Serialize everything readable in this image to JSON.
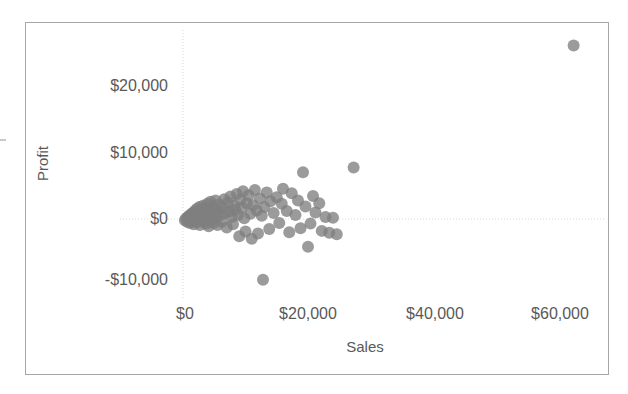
{
  "chart_data": {
    "type": "scatter",
    "title": "",
    "xlabel": "Sales",
    "ylabel": "Profit",
    "xticks": [
      "$0",
      "$20,000",
      "$40,000",
      "$60,000"
    ],
    "xtick_values": [
      0,
      20000,
      40000,
      60000
    ],
    "yticks": [
      "$20,000",
      "$10,000",
      "$0",
      "-$10,000"
    ],
    "ytick_values": [
      20000,
      10000,
      0,
      -10000
    ],
    "xlim": [
      -3000,
      66000
    ],
    "ylim": [
      -14000,
      28000
    ],
    "grid": "zero-lines-only",
    "legend": "none",
    "marker_color": "#7f7f7f",
    "marker_opacity": 0.78,
    "marker_radius": 6,
    "points": [
      [
        300,
        -200
      ],
      [
        500,
        100
      ],
      [
        650,
        -400
      ],
      [
        800,
        300
      ],
      [
        900,
        -100
      ],
      [
        1000,
        500
      ],
      [
        1100,
        -600
      ],
      [
        1200,
        200
      ],
      [
        1300,
        700
      ],
      [
        1400,
        -300
      ],
      [
        1500,
        900
      ],
      [
        1600,
        100
      ],
      [
        1700,
        -800
      ],
      [
        1800,
        600
      ],
      [
        1900,
        1200
      ],
      [
        2000,
        -200
      ],
      [
        2100,
        400
      ],
      [
        2200,
        1500
      ],
      [
        2300,
        -500
      ],
      [
        2400,
        800
      ],
      [
        2500,
        200
      ],
      [
        2600,
        1800
      ],
      [
        2700,
        -900
      ],
      [
        2800,
        600
      ],
      [
        2900,
        1300
      ],
      [
        3000,
        -100
      ],
      [
        3100,
        900
      ],
      [
        3200,
        2000
      ],
      [
        3300,
        -400
      ],
      [
        3400,
        500
      ],
      [
        3500,
        1600
      ],
      [
        3600,
        100
      ],
      [
        3700,
        -700
      ],
      [
        3800,
        1100
      ],
      [
        3900,
        2300
      ],
      [
        4000,
        300
      ],
      [
        4100,
        -1100
      ],
      [
        4200,
        1400
      ],
      [
        4300,
        700
      ],
      [
        4400,
        2600
      ],
      [
        4500,
        -300
      ],
      [
        4600,
        1000
      ],
      [
        4700,
        1900
      ],
      [
        4800,
        200
      ],
      [
        4900,
        -600
      ],
      [
        5000,
        1500
      ],
      [
        5200,
        2800
      ],
      [
        5400,
        400
      ],
      [
        5500,
        -900
      ],
      [
        5600,
        1200
      ],
      [
        5800,
        2200
      ],
      [
        6000,
        600
      ],
      [
        6200,
        -400
      ],
      [
        6400,
        1700
      ],
      [
        6600,
        3000
      ],
      [
        6800,
        900
      ],
      [
        7000,
        -1300
      ],
      [
        7200,
        2500
      ],
      [
        7400,
        1100
      ],
      [
        7600,
        3400
      ],
      [
        7800,
        300
      ],
      [
        8000,
        -800
      ],
      [
        8200,
        2000
      ],
      [
        8400,
        1400
      ],
      [
        8600,
        3800
      ],
      [
        8800,
        600
      ],
      [
        9000,
        -2600
      ],
      [
        9200,
        2900
      ],
      [
        9400,
        1700
      ],
      [
        9600,
        4200
      ],
      [
        9800,
        100
      ],
      [
        10000,
        -1900
      ],
      [
        10200,
        2400
      ],
      [
        10500,
        3600
      ],
      [
        10800,
        800
      ],
      [
        11000,
        -3000
      ],
      [
        11200,
        2100
      ],
      [
        11500,
        4400
      ],
      [
        11800,
        1300
      ],
      [
        12000,
        -2200
      ],
      [
        12300,
        3100
      ],
      [
        12600,
        500
      ],
      [
        12800,
        -9200
      ],
      [
        13000,
        1800
      ],
      [
        13400,
        4000
      ],
      [
        13800,
        -1500
      ],
      [
        14000,
        2700
      ],
      [
        14500,
        900
      ],
      [
        15000,
        3300
      ],
      [
        15400,
        -600
      ],
      [
        15800,
        2300
      ],
      [
        16000,
        4600
      ],
      [
        16600,
        1200
      ],
      [
        17000,
        -2000
      ],
      [
        17400,
        3900
      ],
      [
        18000,
        600
      ],
      [
        18400,
        2800
      ],
      [
        18800,
        -1400
      ],
      [
        19200,
        7100
      ],
      [
        19600,
        1900
      ],
      [
        20000,
        -4200
      ],
      [
        20400,
        -700
      ],
      [
        20800,
        3500
      ],
      [
        21200,
        1000
      ],
      [
        21800,
        2400
      ],
      [
        22200,
        -1800
      ],
      [
        22800,
        300
      ],
      [
        23400,
        -2100
      ],
      [
        24000,
        200
      ],
      [
        24600,
        -2300
      ],
      [
        27300,
        7800
      ],
      [
        62500,
        26300
      ]
    ]
  }
}
